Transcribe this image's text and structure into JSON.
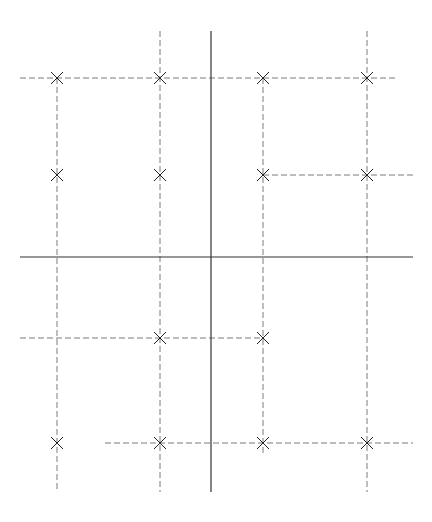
{
  "diagram": {
    "width": 432,
    "height": 522,
    "background": "#ffffff",
    "colors": {
      "axis": "#333333",
      "dashed": "#7a7a7a",
      "marker": "#222222"
    },
    "axes": [
      {
        "id": "horizontal-axis",
        "x1": 20,
        "y1": 257,
        "x2": 413,
        "y2": 257
      },
      {
        "id": "vertical-axis",
        "x1": 211,
        "y1": 31,
        "x2": 211,
        "y2": 492
      }
    ],
    "dashed_lines": [
      {
        "id": "v-line-1",
        "x1": 57,
        "y1": 78,
        "x2": 57,
        "y2": 492
      },
      {
        "id": "v-line-2",
        "x1": 160,
        "y1": 31,
        "x2": 160,
        "y2": 492
      },
      {
        "id": "v-line-3",
        "x1": 263,
        "y1": 78,
        "x2": 263,
        "y2": 453
      },
      {
        "id": "v-line-4",
        "x1": 367,
        "y1": 31,
        "x2": 367,
        "y2": 492
      },
      {
        "id": "h-line-1",
        "x1": 20,
        "y1": 78,
        "x2": 395,
        "y2": 78
      },
      {
        "id": "h-line-2",
        "x1": 263,
        "y1": 175,
        "x2": 413,
        "y2": 175
      },
      {
        "id": "h-line-3",
        "x1": 20,
        "y1": 338,
        "x2": 263,
        "y2": 338
      },
      {
        "id": "h-line-4",
        "x1": 105,
        "y1": 443,
        "x2": 413,
        "y2": 443
      }
    ],
    "markers": [
      {
        "x": 57,
        "y": 78
      },
      {
        "x": 160,
        "y": 78
      },
      {
        "x": 263,
        "y": 78
      },
      {
        "x": 367,
        "y": 78
      },
      {
        "x": 57,
        "y": 175
      },
      {
        "x": 160,
        "y": 175
      },
      {
        "x": 263,
        "y": 175
      },
      {
        "x": 367,
        "y": 175
      },
      {
        "x": 160,
        "y": 338
      },
      {
        "x": 263,
        "y": 338
      },
      {
        "x": 57,
        "y": 443
      },
      {
        "x": 160,
        "y": 443
      },
      {
        "x": 263,
        "y": 443
      },
      {
        "x": 367,
        "y": 443
      }
    ],
    "marker_size": 6
  }
}
